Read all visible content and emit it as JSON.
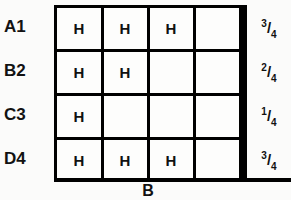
{
  "figure": {
    "caption_bottom": "B",
    "row_labels": [
      "A1",
      "B2",
      "C3",
      "D4"
    ],
    "column_count": 4,
    "marker": "H",
    "colors": {
      "line": "#000000",
      "text": "#111111",
      "background": "#fbfbfa",
      "cell_fill": "#fdfdfc"
    },
    "rows": [
      {
        "label": "A1",
        "cells": [
          "H",
          "H",
          "H",
          ""
        ],
        "score": {
          "numerator": "3",
          "separator": "/",
          "denominator": "4",
          "text": "3/4"
        }
      },
      {
        "label": "B2",
        "cells": [
          "H",
          "H",
          "",
          ""
        ],
        "score": {
          "numerator": "2",
          "separator": "/",
          "denominator": "4",
          "text": "2/4"
        }
      },
      {
        "label": "C3",
        "cells": [
          "H",
          "",
          "",
          ""
        ],
        "score": {
          "numerator": "1",
          "separator": "/",
          "denominator": "4",
          "text": "1/4"
        }
      },
      {
        "label": "D4",
        "cells": [
          "H",
          "H",
          "H",
          ""
        ],
        "score": {
          "numerator": "3",
          "separator": "/",
          "denominator": "4",
          "text": "3/4"
        }
      }
    ]
  }
}
